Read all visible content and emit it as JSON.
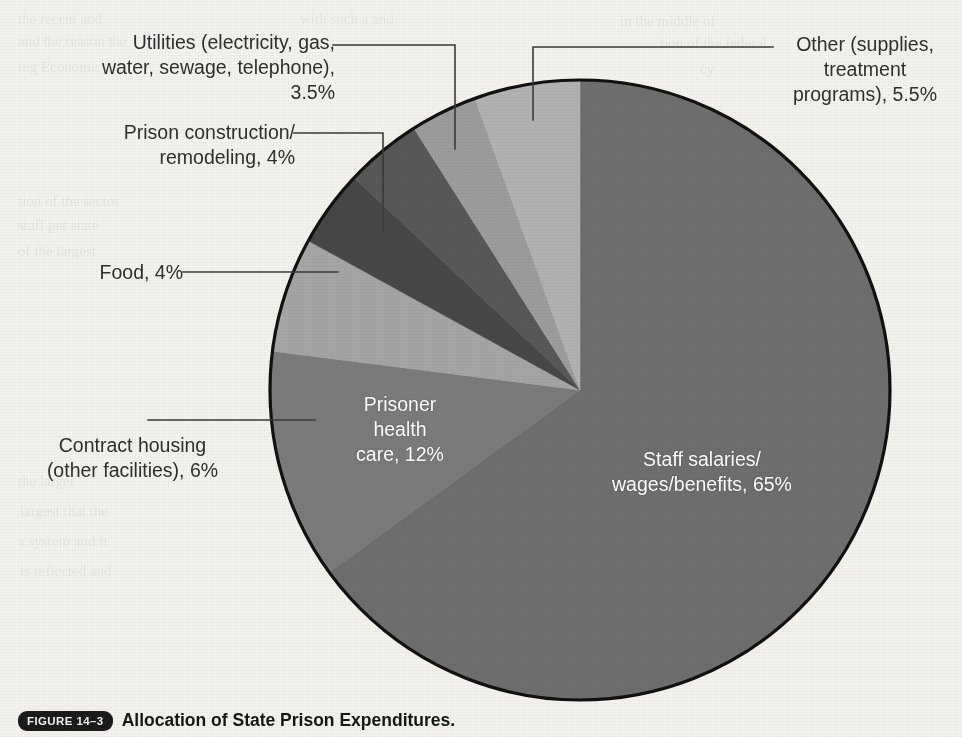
{
  "figure": {
    "badge": "FIGURE 14–3",
    "caption": "Allocation of State Prison Expenditures.",
    "background_color": "#f4f2ee"
  },
  "chart_data": {
    "type": "pie",
    "title": "Allocation of State Prison Expenditures",
    "units": "percent",
    "total": 100,
    "start_angle_deg": 0,
    "direction": "clockwise",
    "legend": "none (direct labels)",
    "grid": false,
    "categories": [
      "Staff salaries/wages/benefits",
      "Prisoner health care",
      "Contract housing (other facilities)",
      "Food",
      "Prison construction/remodeling",
      "Utilities (electricity, gas, water, sewage, telephone)",
      "Other (supplies, treatment programs)"
    ],
    "values": [
      65,
      12,
      6,
      4,
      4,
      3.5,
      5.5
    ],
    "colors": [
      "#6e6e6e",
      "#7b7b7b",
      "#a5a5a5",
      "#474747",
      "#585858",
      "#9c9c9c",
      "#b2b2b2"
    ],
    "slices": [
      {
        "label": "Staff salaries/\nwages/benefits, 65%",
        "name": "Staff salaries/wages/benefits",
        "value": 65,
        "value_text": "65%",
        "color": "#6e6e6e",
        "label_placement": "inside",
        "label_color": "#ffffff"
      },
      {
        "label": "Prisoner\nhealth\ncare, 12%",
        "name": "Prisoner health care",
        "value": 12,
        "value_text": "12%",
        "color": "#7b7b7b",
        "label_placement": "inside",
        "label_color": "#ffffff"
      },
      {
        "label": "Contract housing\n(other facilities), 6%",
        "name": "Contract housing (other facilities)",
        "value": 6,
        "value_text": "6%",
        "color": "#a5a5a5",
        "label_placement": "callout-left",
        "label_color": "#2f2f2f"
      },
      {
        "label": "Food, 4%",
        "name": "Food",
        "value": 4,
        "value_text": "4%",
        "color": "#474747",
        "label_placement": "callout-left",
        "label_color": "#2f2f2f"
      },
      {
        "label": "Prison construction/\nremodeling, 4%",
        "name": "Prison construction/remodeling",
        "value": 4,
        "value_text": "4%",
        "color": "#585858",
        "label_placement": "callout-left",
        "label_color": "#2f2f2f"
      },
      {
        "label": "Utilities (electricity, gas,\nwater, sewage, telephone), 3.5%",
        "name": "Utilities (electricity, gas, water, sewage, telephone)",
        "value": 3.5,
        "value_text": "3.5%",
        "color": "#9c9c9c",
        "label_placement": "callout-top",
        "label_color": "#2f2f2f"
      },
      {
        "label": "Other (supplies,\ntreatment\nprograms), 5.5%",
        "name": "Other (supplies, treatment programs)",
        "value": 5.5,
        "value_text": "5.5%",
        "color": "#b2b2b2",
        "label_placement": "callout-top-right",
        "label_color": "#2f2f2f"
      }
    ]
  },
  "ghost_text": {
    "lines": [
      "the recent and",
      "with such a and",
      "in the middle of",
      "and the reason the",
      "tion of the federal",
      "ing   Economic",
      "cy",
      "tion of the sector",
      "and prevently",
      "staff per state",
      "A final in make",
      "of the largest",
      "be proper in the",
      "the larger",
      "largest that the",
      "as a concern that",
      "a system and it",
      "entirely new idea of an",
      "is reflected and"
    ]
  }
}
